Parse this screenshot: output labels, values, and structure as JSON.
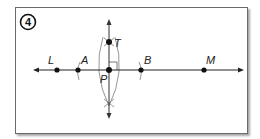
{
  "step": {
    "number": "4"
  },
  "diagram": {
    "points": [
      {
        "id": "L",
        "label": "L",
        "x": 57,
        "y": 70
      },
      {
        "id": "A",
        "label": "A",
        "x": 78,
        "y": 70
      },
      {
        "id": "P",
        "label": "P",
        "x": 109,
        "y": 70
      },
      {
        "id": "B",
        "label": "B",
        "x": 141,
        "y": 70
      },
      {
        "id": "M",
        "label": "M",
        "x": 204,
        "y": 70
      },
      {
        "id": "T",
        "label": "T",
        "x": 109,
        "y": 42
      }
    ],
    "lines": {
      "horizontal": {
        "name": "line LM",
        "through": [
          "L",
          "A",
          "P",
          "B",
          "M"
        ],
        "arrows": "both"
      },
      "vertical": {
        "name": "line PT",
        "through": [
          "T",
          "P"
        ],
        "arrows": "both"
      }
    },
    "arcs": [
      "arc through A",
      "arc through B",
      "lens arcs intersecting at T and below P"
    ],
    "marks": [
      "right-angle mark at P"
    ],
    "colors": {
      "line": "#222222",
      "arc": "#8a8a8a",
      "point": "#111111",
      "frame": "#6a6a6a"
    }
  }
}
